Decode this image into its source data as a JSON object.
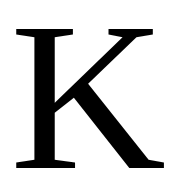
{
  "glyph": {
    "character": "K",
    "color": "#000000",
    "background": "#ffffff"
  }
}
